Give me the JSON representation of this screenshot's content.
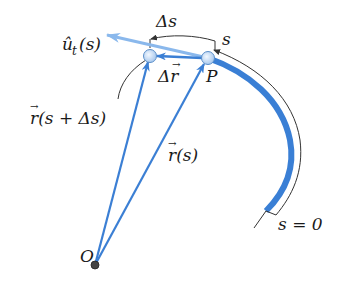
{
  "labels": {
    "unit_tangent": "û",
    "unit_tangent_sub": "t",
    "unit_tangent_arg": "(s)",
    "delta_s": "Δs",
    "s_arc": "s",
    "delta_r": "Δr",
    "point_p": "P",
    "r_s_plus": "r(s + Δs)",
    "r_s": "r(s)",
    "s_zero": "s = 0",
    "origin": "O",
    "vec_arrow": "→"
  },
  "colors": {
    "vector_blue": "#3b7fd4",
    "tangent_light_blue": "#8ab8ec",
    "curve_blue": "#3a7fd5",
    "thin_line": "#333333",
    "point_fill": "#cfe2f7",
    "point_stroke": "#5b8fc9",
    "origin_fill": "#444444"
  }
}
